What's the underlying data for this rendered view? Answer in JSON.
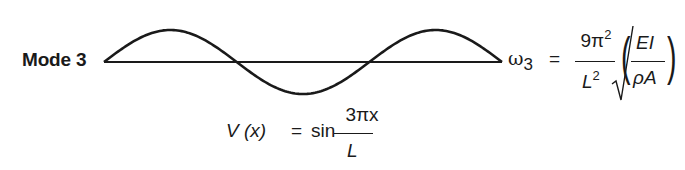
{
  "diagram": {
    "mode_label": "Mode 3",
    "waveform": {
      "type": "sine",
      "half_waves": 3,
      "axis": {
        "x_start": 104,
        "x_end": 502,
        "y": 62
      },
      "amplitude_px": 32,
      "stroke_color": "#1a1a1a"
    },
    "frequency": {
      "symbol": "ω",
      "subscript": "3",
      "equals": "=",
      "coef_num": "9π",
      "coef_num_exp": "2",
      "coef_den": "L",
      "coef_den_exp": "2",
      "radical": "√",
      "inner_num": "EI",
      "inner_den": "ρA",
      "open_paren": "(",
      "close_paren": ")"
    },
    "mode_shape": {
      "lhs": "V (x)",
      "equals": "=",
      "func": "sin",
      "num": "3πx",
      "den": "L"
    }
  }
}
